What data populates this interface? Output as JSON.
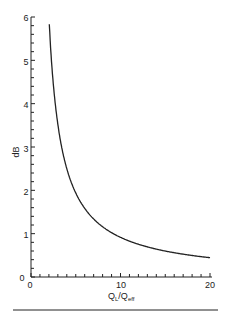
{
  "chart_data": {
    "type": "line",
    "title": "",
    "xlabel": "Q_L/Q_eff",
    "ylabel": "dB",
    "xlim": [
      0,
      20
    ],
    "ylim": [
      0,
      6
    ],
    "x_ticks": [
      0,
      10,
      20
    ],
    "y_ticks": [
      0,
      1,
      2,
      3,
      4,
      5,
      6
    ],
    "grid": false,
    "series": [
      {
        "name": "insertion loss",
        "x": [
          2,
          2.5,
          3,
          4,
          5,
          6,
          7,
          8,
          10,
          12,
          14,
          16,
          18,
          20
        ],
        "y": [
          6.02,
          3.98,
          3.52,
          2.5,
          1.94,
          1.58,
          1.34,
          1.16,
          0.92,
          0.76,
          0.64,
          0.56,
          0.5,
          0.45
        ]
      }
    ]
  },
  "labels": {
    "y_axis": "dB",
    "x_axis_main": "Q",
    "x_axis_sub1": "L",
    "x_axis_slash": "/Q",
    "x_axis_sub2": "eff",
    "x_tick_0": "0",
    "x_tick_10": "10",
    "x_tick_20": "20",
    "y_tick_0": "0",
    "y_tick_1": "1",
    "y_tick_2": "2",
    "y_tick_3": "3",
    "y_tick_4": "4",
    "y_tick_5": "5",
    "y_tick_6": "6"
  }
}
